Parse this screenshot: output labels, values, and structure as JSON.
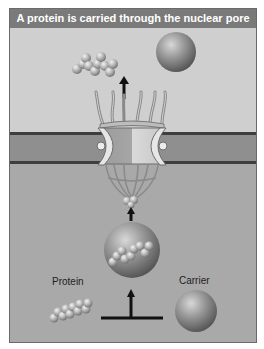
{
  "title": "A protein is carried through the nuclear pore",
  "labels": {
    "protein": "Protein",
    "carrier": "Carrier"
  },
  "regions": {
    "cytoplasm": "upper compartment",
    "nuclear_envelope": "membrane band with nuclear pore complex",
    "nucleus": "lower compartment"
  },
  "colors": {
    "header_bg": "#7a7a7a",
    "header_text": "#ffffff",
    "upper_bg": "#cfcfcf",
    "membrane": "#8f8f8f",
    "membrane_edge": "#3e3e3e",
    "lower_bg": "#a9a9a9",
    "arrow": "#111111"
  }
}
